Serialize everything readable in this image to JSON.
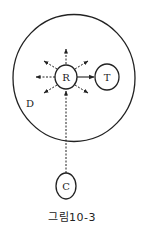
{
  "figure": {
    "caption": "그림10-3",
    "region_label": "D",
    "nodes": {
      "R": {
        "label": "R"
      },
      "T": {
        "label": "T"
      },
      "C": {
        "label": "C"
      }
    },
    "edges": [
      {
        "from": "R",
        "to": "T",
        "style": "solid"
      },
      {
        "from": "C",
        "to": "R",
        "style": "dashed"
      }
    ],
    "radiating_arrows_from_R": [
      "up",
      "up-left",
      "left",
      "down-left",
      "down-right",
      "up-right"
    ],
    "colors": {
      "stroke": "#222222",
      "background": "#ffffff"
    }
  }
}
